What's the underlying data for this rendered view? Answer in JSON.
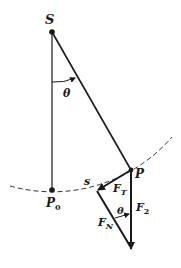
{
  "diagram": {
    "labels": {
      "pivot": "S",
      "angle_top": "θ",
      "equilibrium": "P",
      "equilibrium_sub": "0",
      "bob": "P",
      "arc": "s",
      "tangential": "F",
      "tangential_sub": "T",
      "normal": "F",
      "normal_sub": "N",
      "angle_bottom": "θ",
      "weight": "F",
      "weight_sub": "2"
    },
    "colors": {
      "ink": "#1a1a1a",
      "background": "#ffffff"
    }
  }
}
